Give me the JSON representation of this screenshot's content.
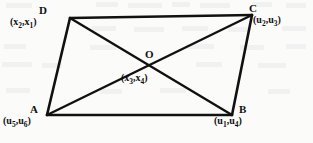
{
  "figure": {
    "type": "geometry-diagram",
    "background_color": "#fbfbfa",
    "line_color": "#111111",
    "vertices": [
      {
        "id": "D",
        "letter": "D",
        "coord_open": "(",
        "coord_v1": "x",
        "coord_v1_sub": "2",
        "coord_sep": ",",
        "coord_v2": "x",
        "coord_v2_sub": "1",
        "coord_close": ")",
        "x": 70,
        "y": 18
      },
      {
        "id": "C",
        "letter": "C",
        "coord_open": "(",
        "coord_v1": "u",
        "coord_v1_sub": "2",
        "coord_sep": ",",
        "coord_v2": "u",
        "coord_v2_sub": "3",
        "coord_close": ")",
        "x": 252,
        "y": 15
      },
      {
        "id": "O",
        "letter": "O",
        "coord_open": "(",
        "coord_v1": "x",
        "coord_v1_sub": "3",
        "coord_sep": ",",
        "coord_v2": "x",
        "coord_v2_sub": "4",
        "coord_close": ")",
        "x": 148,
        "y": 70
      },
      {
        "id": "A",
        "letter": "A",
        "coord_open": "(",
        "coord_v1": "u",
        "coord_v1_sub": "5",
        "coord_sep": ",",
        "coord_v2": "u",
        "coord_v2_sub": "6",
        "coord_close": ")",
        "x": 47,
        "y": 115
      },
      {
        "id": "B",
        "letter": "B",
        "coord_open": "(",
        "coord_v1": "u",
        "coord_v1_sub": "1",
        "coord_sep": ",",
        "coord_v2": "u",
        "coord_v2_sub": "4",
        "coord_close": ")",
        "x": 232,
        "y": 115
      }
    ],
    "edges": [
      {
        "name": "edge-DC",
        "from": "D",
        "to": "C"
      },
      {
        "name": "edge-CB",
        "from": "C",
        "to": "B"
      },
      {
        "name": "edge-BA",
        "from": "B",
        "to": "A"
      },
      {
        "name": "edge-AD",
        "from": "A",
        "to": "D"
      }
    ],
    "diagonals": [
      {
        "name": "diagonal-AC",
        "from": "A",
        "to": "C"
      },
      {
        "name": "diagonal-DB",
        "from": "D",
        "to": "B"
      }
    ]
  }
}
